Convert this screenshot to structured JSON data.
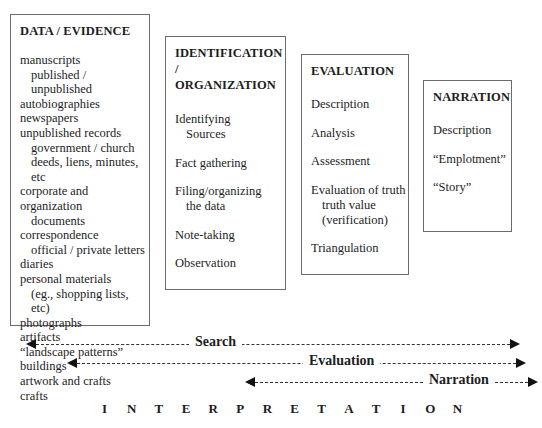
{
  "boxes": {
    "data_evidence": {
      "title": "DATA / EVIDENCE",
      "items": [
        {
          "text": "manuscripts",
          "level": 0
        },
        {
          "text": "published / unpublished",
          "level": 1
        },
        {
          "text": "autobiographies",
          "level": 0
        },
        {
          "text": "newspapers",
          "level": 0
        },
        {
          "text": "unpublished records",
          "level": 0
        },
        {
          "text": "government / church",
          "level": 1
        },
        {
          "text": "deeds, liens, minutes, etc",
          "level": 1
        },
        {
          "text": "corporate and organization",
          "level": 0
        },
        {
          "text": "documents",
          "level": 1
        },
        {
          "text": "correspondence",
          "level": 0
        },
        {
          "text": "official / private letters",
          "level": 1
        },
        {
          "text": "diaries",
          "level": 0
        },
        {
          "text": "personal materials",
          "level": 0
        },
        {
          "text": "(eg., shopping lists, etc)",
          "level": 1
        },
        {
          "text": "photographs",
          "level": 0
        },
        {
          "text": "artifacts",
          "level": 0
        },
        {
          "text": "“landscape patterns”",
          "level": 0
        },
        {
          "text": "buildings",
          "level": 0
        },
        {
          "text": "artwork and crafts",
          "level": 0
        },
        {
          "text": "crafts",
          "level": 0
        }
      ]
    },
    "identification": {
      "title_line1": "IDENTIFICATION /",
      "title_line2": "ORGANIZATION",
      "items": [
        {
          "text": "Identifying",
          "cont": "Sources"
        },
        {
          "text": "Fact gathering"
        },
        {
          "text": "Filing/organizing",
          "cont": "the data"
        },
        {
          "text": "Note-taking"
        },
        {
          "text": "Observation"
        }
      ]
    },
    "evaluation": {
      "title": "EVALUATION",
      "items": [
        {
          "text": "Description"
        },
        {
          "text": "Analysis"
        },
        {
          "text": "Assessment"
        },
        {
          "text": "Evaluation of truth",
          "cont": "truth value",
          "cont2": "(verification)"
        },
        {
          "text": "Triangulation"
        }
      ]
    },
    "narration": {
      "title": "NARRATION",
      "items": [
        {
          "text": "Description"
        },
        {
          "text": "“Emplotment”"
        },
        {
          "text": "“Story”"
        }
      ]
    }
  },
  "arrows": {
    "search": {
      "label": "Search"
    },
    "evaluation": {
      "label": "Evaluation"
    },
    "narration": {
      "label": "Narration"
    }
  },
  "interpretation": {
    "label": "INTERPRETATION",
    "letters": [
      "I",
      "N",
      "T",
      "E",
      "R",
      "P",
      "R",
      "E",
      "T",
      "A",
      "T",
      "I",
      "O",
      "N"
    ]
  }
}
